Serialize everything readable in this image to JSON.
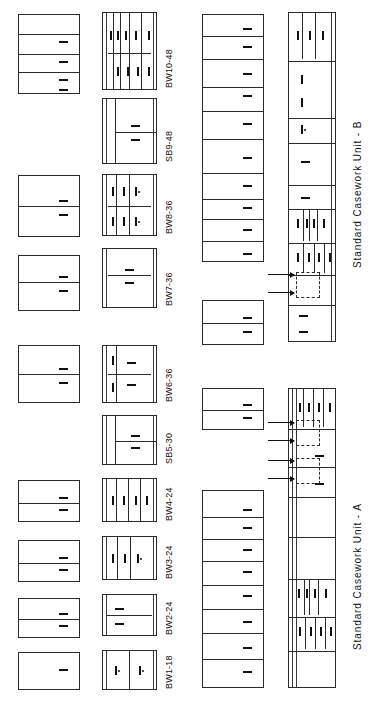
{
  "sheet": {
    "title_a": "Standard Casework Unit  -  A",
    "title_b": "Standard Casework Unit  -  B",
    "background_color": "#ffffff",
    "line_color": "#2b2b2b"
  },
  "unit_labels": [
    {
      "id": "bw10-48",
      "text": "BW10-48"
    },
    {
      "id": "sb9-48",
      "text": "SB9-48"
    },
    {
      "id": "bw8-36",
      "text": "BW8-36"
    },
    {
      "id": "bw7-36",
      "text": "BW7-36"
    },
    {
      "id": "bw6-36",
      "text": "BW6-36"
    },
    {
      "id": "sb5-30",
      "text": "SB5-30"
    },
    {
      "id": "bw4-24",
      "text": "BW4-24"
    },
    {
      "id": "bw3-24",
      "text": "BW3-24"
    },
    {
      "id": "bw2-24",
      "text": "BW2-24"
    },
    {
      "id": "bw1-18",
      "text": "BW1-18"
    }
  ],
  "plan_views": {
    "description": "Left column of plain rectangular plan/section outlines, one per casework unit",
    "count": 8
  },
  "elevations": {
    "description": "Second column of detailed cabinet elevations with doors, drawers and pulls",
    "count": 10
  },
  "sections": {
    "description": "Third column: stacked tall section stacks of drawer banks",
    "count": 3
  },
  "assemblies": [
    {
      "id": "unit-b",
      "label": "Standard Casework Unit  -  B"
    },
    {
      "id": "unit-a",
      "label": "Standard Casework Unit  -  A"
    }
  ]
}
